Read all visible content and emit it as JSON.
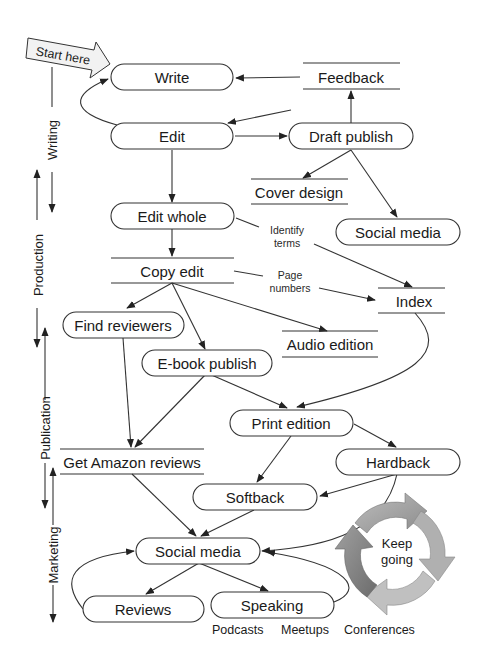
{
  "start_label": "Start here",
  "phases": [
    {
      "id": "writing",
      "label": "Writing"
    },
    {
      "id": "production",
      "label": "Production"
    },
    {
      "id": "publication",
      "label": "Publication"
    },
    {
      "id": "marketing",
      "label": "Marketing"
    }
  ],
  "nodes": {
    "write": "Write",
    "feedback": "Feedback",
    "edit": "Edit",
    "draft_publish": "Draft publish",
    "cover_design": "Cover design",
    "social_media_top": "Social media",
    "edit_whole": "Edit whole",
    "copy_edit": "Copy edit",
    "index": "Index",
    "find_reviewers": "Find reviewers",
    "audio_edition": "Audio edition",
    "ebook_publish": "E-book publish",
    "print_edition": "Print edition",
    "get_amazon_reviews": "Get Amazon reviews",
    "hardback": "Hardback",
    "softback": "Softback",
    "social_media": "Social media",
    "reviews": "Reviews",
    "speaking": "Speaking"
  },
  "edge_labels": {
    "identify_terms": [
      "Identify",
      "terms"
    ],
    "page_numbers": [
      "Page",
      "numbers"
    ]
  },
  "speaking_types": [
    "Podcasts",
    "Meetups",
    "Conferences"
  ],
  "keep_going": [
    "Keep",
    "going"
  ],
  "colors": {
    "line": "#333333",
    "arrow_light": "#a9a9a9",
    "arrow_mid": "#8a8a8a",
    "arrow_dark": "#6f6f6f"
  }
}
